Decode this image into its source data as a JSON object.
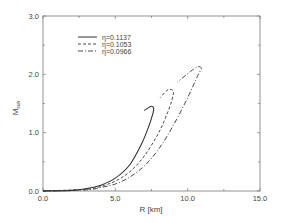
{
  "chart_data": {
    "type": "line",
    "title": "",
    "xlabel": "R [km]",
    "ylabel": "M",
    "ylabel_subscript": "sun",
    "xlim": [
      0,
      15
    ],
    "ylim": [
      0,
      3
    ],
    "xticks": [
      0.0,
      5.0,
      10.0,
      15.0
    ],
    "xtick_labels": [
      "0.0",
      "5.0",
      "10.0",
      "15.0"
    ],
    "yticks": [
      0.0,
      1.0,
      2.0,
      3.0
    ],
    "ytick_labels": [
      "0.0",
      "1.0",
      "2.0",
      "3.0"
    ],
    "grid": false,
    "legend_position": "upper left",
    "series": [
      {
        "name": "η=0.1137",
        "style": "solid",
        "points": [
          [
            0,
            0
          ],
          [
            2,
            0.01
          ],
          [
            3,
            0.04
          ],
          [
            4,
            0.1
          ],
          [
            5,
            0.22
          ],
          [
            6,
            0.45
          ],
          [
            6.8,
            0.8
          ],
          [
            7.3,
            1.1
          ],
          [
            7.6,
            1.33
          ],
          [
            7.65,
            1.42
          ],
          [
            7.45,
            1.45
          ],
          [
            7.0,
            1.38
          ]
        ]
      },
      {
        "name": "η=0.1053",
        "style": "dashed",
        "points": [
          [
            0,
            0
          ],
          [
            3,
            0.03
          ],
          [
            4,
            0.08
          ],
          [
            5,
            0.17
          ],
          [
            6,
            0.33
          ],
          [
            7,
            0.6
          ],
          [
            8,
            1.0
          ],
          [
            8.7,
            1.4
          ],
          [
            9.0,
            1.65
          ],
          [
            8.95,
            1.73
          ],
          [
            8.6,
            1.73
          ],
          [
            8.1,
            1.6
          ]
        ]
      },
      {
        "name": "η=0.0966",
        "style": "dash-dot",
        "points": [
          [
            0,
            0
          ],
          [
            3,
            0.02
          ],
          [
            4,
            0.06
          ],
          [
            5,
            0.12
          ],
          [
            6,
            0.24
          ],
          [
            7,
            0.43
          ],
          [
            8,
            0.72
          ],
          [
            9,
            1.12
          ],
          [
            10,
            1.6
          ],
          [
            10.7,
            1.98
          ],
          [
            10.95,
            2.1
          ],
          [
            10.7,
            2.13
          ],
          [
            10.2,
            2.05
          ],
          [
            9.3,
            1.87
          ]
        ]
      }
    ]
  },
  "legend": {
    "items": [
      {
        "label": "η=0.1137"
      },
      {
        "label": "η=0.1053"
      },
      {
        "label": "η=0.0966"
      }
    ]
  }
}
